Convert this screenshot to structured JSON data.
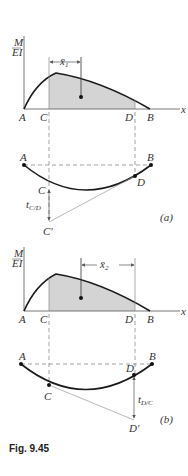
{
  "figure": {
    "caption": "Fig. 9.45",
    "colors": {
      "curve": "#1a1a1a",
      "shade": "#d4d4d4",
      "axis": "#555555",
      "tangent": "#999999",
      "dash": "#777777"
    }
  },
  "panel_a": {
    "y_axis_label_num": "M",
    "y_axis_label_den": "EI",
    "x_axis_label": "x",
    "points": [
      "A",
      "C",
      "D",
      "B"
    ],
    "distance_label": "x̄",
    "distance_sub": "1",
    "beam_labels": {
      "A": "A",
      "B": "B",
      "C": "C",
      "D": "D",
      "Cprime": "C'"
    },
    "deviation_label": "t",
    "deviation_sub": "C/D",
    "panel_tag": "(a)"
  },
  "panel_b": {
    "y_axis_label_num": "M",
    "y_axis_label_den": "EI",
    "x_axis_label": "x",
    "points": [
      "A",
      "C",
      "D",
      "B"
    ],
    "distance_label": "x̄",
    "distance_sub": "2",
    "beam_labels": {
      "A": "A",
      "B": "B",
      "C": "C",
      "D": "D",
      "Dprime": "D'"
    },
    "deviation_label": "t",
    "deviation_sub": "D/C",
    "panel_tag": "(b)"
  }
}
